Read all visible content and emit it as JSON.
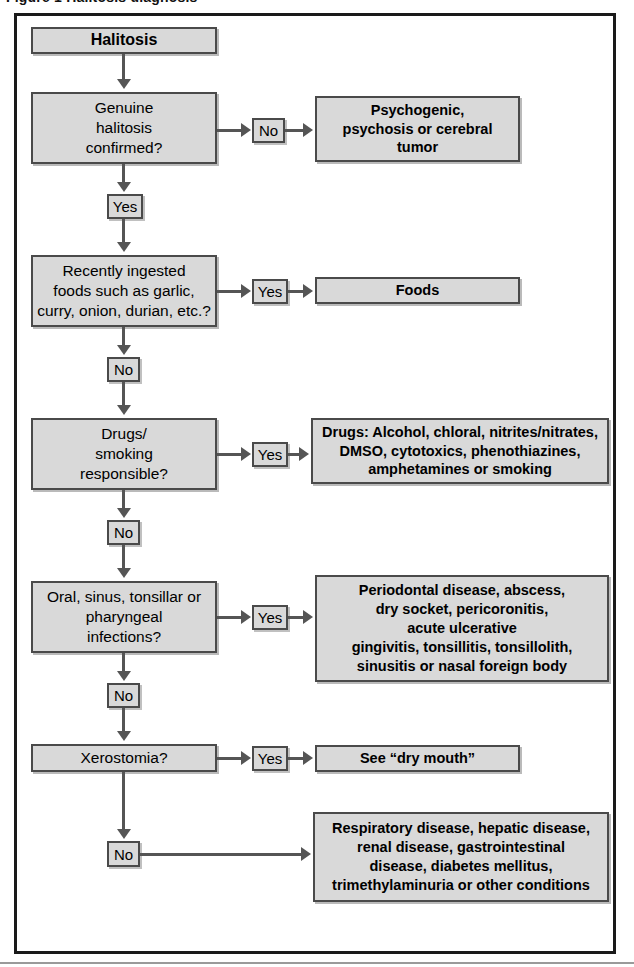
{
  "figure": {
    "caption": "Figure 1  Halitosis diagnosis",
    "frame_color": "#1a1a1a",
    "box_fill": "#d9d9d9",
    "box_border": "#4a4a4a",
    "connector_color": "#555555"
  },
  "nodes": {
    "start": {
      "label": "Halitosis"
    },
    "q1": {
      "label": "Genuine\nhalitosis\nconfirmed?"
    },
    "q1_no_label": "No",
    "q1_yes_label": "Yes",
    "o1": {
      "label": "Psychogenic,\npsychosis or cerebral\ntumor"
    },
    "q2": {
      "label": "Recently ingested\nfoods such as garlic,\ncurry, onion, durian, etc.?"
    },
    "q2_yes_label": "Yes",
    "q2_no_label": "No",
    "o2": {
      "label": "Foods"
    },
    "q3": {
      "label": "Drugs/\nsmoking\nresponsible?"
    },
    "q3_yes_label": "Yes",
    "q3_no_label": "No",
    "o3": {
      "label": "Drugs: Alcohol, chloral, nitrites/nitrates,\nDMSO, cytotoxics, phenothiazines,\namphetamines or smoking"
    },
    "q4": {
      "label": "Oral, sinus, tonsillar or\npharyngeal\ninfections?"
    },
    "q4_yes_label": "Yes",
    "q4_no_label": "No",
    "o4": {
      "label": "Periodontal disease, abscess,\ndry socket, pericoronitis,\nacute ulcerative\ngingivitis, tonsillitis, tonsillolith,\nsinusitis or nasal foreign body"
    },
    "q5": {
      "label": "Xerostomia?"
    },
    "q5_yes_label": "Yes",
    "q5_no_label": "No",
    "o5": {
      "label": "See “dry mouth”"
    },
    "o6": {
      "label": "Respiratory disease, hepatic disease,\nrenal disease, gastrointestinal\ndisease, diabetes mellitus,\ntrimethylaminuria or other conditions"
    }
  }
}
